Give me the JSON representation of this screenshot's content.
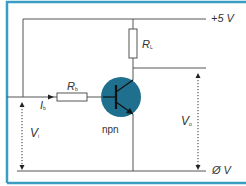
{
  "diagram": {
    "type": "npn transistor switching circuit",
    "colors": {
      "frame": "#3a9ec2",
      "wire": "#555555",
      "transistor_fill": "#1f6f8f",
      "transistor_symbol": "#111111",
      "text": "#333333"
    },
    "labels": {
      "supply": "+5 V",
      "ground": "Ø V",
      "rl_main": "R",
      "rl_sub": "L",
      "rb_main": "R",
      "rb_sub": "b",
      "ib_main": "I",
      "ib_sub": "b",
      "vi_main": "V",
      "vi_sub": "i",
      "vo_main": "V",
      "vo_sub": "o",
      "transistor_type": "npn"
    }
  }
}
